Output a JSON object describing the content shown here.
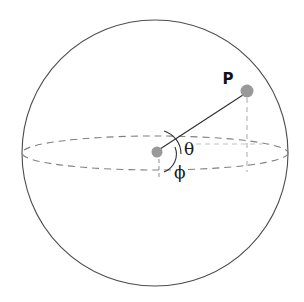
{
  "figure": {
    "type": "spherical-coordinate-diagram",
    "background_color": "#ffffff",
    "width": 304,
    "height": 302
  },
  "labels": {
    "point_label": "P",
    "polar_angle_label": "θ",
    "azimuth_angle_label": "ϕ"
  },
  "geometry": {
    "sphere": {
      "center_x": 155,
      "center_y": 153,
      "radius": 133,
      "stroke_color": "#4d4d4d",
      "stroke_width": 1.1
    },
    "equator_ellipse": {
      "center_x": 155,
      "center_y": 153,
      "radius_x": 133,
      "radius_y": 17,
      "stroke_color": "#808080",
      "stroke_width": 1.1,
      "dash": "7 5"
    },
    "origin_dot": {
      "cx": 157,
      "cy": 152,
      "r": 5.5,
      "fill": "#999999"
    },
    "point_p_dot": {
      "cx": 247,
      "cy": 91,
      "r": 6.5,
      "fill": "#999999"
    },
    "radius_line": {
      "x1": 157,
      "y1": 151,
      "x2": 246,
      "y2": 93,
      "stroke_color": "#333333",
      "stroke_width": 1.2
    },
    "projection_drop_line": {
      "x1": 247,
      "y1": 98,
      "x2": 247,
      "y2": 172,
      "stroke_color": "#b3b3b3",
      "stroke_width": 1.1,
      "dash": "5 4"
    },
    "horizontal_guide_line": {
      "x1": 196,
      "y1": 144,
      "x2": 262,
      "y2": 144,
      "stroke_color": "#c2c2c2",
      "stroke_width": 1.1,
      "dash": "5 4"
    },
    "axis_tick_line": {
      "x1": 159,
      "y1": 159,
      "x2": 159,
      "y2": 177,
      "stroke_color": "#999999",
      "stroke_width": 1.1,
      "dash": "4 3"
    },
    "theta_arc": {
      "stroke_color": "#333333",
      "stroke_width": 1.1,
      "path": "M 164 131 A 24 24 0 0 1 181 154"
    },
    "phi_arc": {
      "stroke_color": "#333333",
      "stroke_width": 1.1,
      "path": "M 175 147 A 19 19 0 0 1 164 172"
    },
    "label_positions": {
      "point_label_x": 228,
      "point_label_y": 84,
      "theta_x": 184,
      "theta_y": 155,
      "phi_x": 174,
      "phi_y": 178
    }
  },
  "colors": {
    "sphere_outline": "#4d4d4d",
    "equator_dashed": "#808080",
    "marker_gray": "#999999",
    "guide_light_gray": "#b3b3b3",
    "text_black": "#1a1a1a"
  }
}
